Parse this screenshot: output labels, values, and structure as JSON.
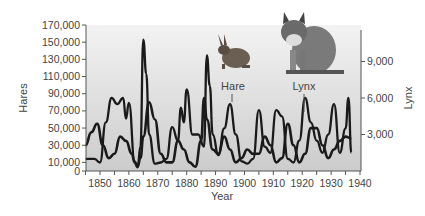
{
  "chart_data": {
    "type": "line",
    "title": "",
    "xlabel": "Year",
    "ylabel": "Hares",
    "y2label": "Lynx",
    "xlim": [
      1845,
      1940
    ],
    "ylim": [
      0,
      170000
    ],
    "y2lim": [
      0,
      12000
    ],
    "x_ticks": [
      "1850",
      "1860",
      "1870",
      "1880",
      "1890",
      "1900",
      "1910",
      "1920",
      "1930",
      "1940"
    ],
    "y_ticks": [
      "0",
      "10,000",
      "30,000",
      "50,000",
      "70,000",
      "90,000",
      "110,000",
      "130,000",
      "150,000",
      "170,000"
    ],
    "y2_ticks": [
      "3,000",
      "6,000",
      "9,000"
    ],
    "annotations": [
      "Hare",
      "Lynx"
    ],
    "series": [
      {
        "name": "Hare",
        "axis": "left",
        "x": [
          1845,
          1847,
          1849,
          1851,
          1853,
          1855,
          1857,
          1859,
          1861,
          1862,
          1863,
          1864,
          1865,
          1867,
          1869,
          1871,
          1873,
          1875,
          1877,
          1879,
          1881,
          1883,
          1885,
          1886,
          1887,
          1889,
          1891,
          1893,
          1895,
          1897,
          1899,
          1901,
          1903,
          1905,
          1907,
          1909,
          1911,
          1913,
          1915,
          1917,
          1919,
          1921,
          1923,
          1925,
          1927,
          1929,
          1931,
          1933,
          1935,
          1937
        ],
        "values": [
          30000,
          45000,
          55000,
          30000,
          15000,
          20000,
          40000,
          35000,
          20000,
          10000,
          5000,
          15000,
          40000,
          80000,
          60000,
          20000,
          10000,
          10000,
          35000,
          25000,
          10000,
          5000,
          35000,
          85000,
          60000,
          25000,
          20000,
          40000,
          25000,
          10000,
          15000,
          25000,
          20000,
          20000,
          40000,
          30000,
          10000,
          15000,
          55000,
          30000,
          10000,
          20000,
          50000,
          50000,
          30000,
          15000,
          25000,
          35000,
          40000,
          38000
        ]
      },
      {
        "name": "Lynx",
        "axis": "right",
        "x": [
          1845,
          1848,
          1850,
          1852,
          1854,
          1856,
          1858,
          1859,
          1860,
          1862,
          1863,
          1864,
          1865,
          1866,
          1867,
          1869,
          1871,
          1873,
          1875,
          1877,
          1878,
          1879,
          1880,
          1882,
          1884,
          1886,
          1887,
          1888,
          1889,
          1891,
          1893,
          1895,
          1897,
          1899,
          1901,
          1903,
          1905,
          1907,
          1909,
          1911,
          1913,
          1915,
          1917,
          1919,
          1921,
          1923,
          1925,
          1927,
          1929,
          1931,
          1933,
          1935,
          1936,
          1937
        ],
        "values": [
          1000,
          1000,
          700,
          4000,
          6000,
          5500,
          6000,
          4300,
          5600,
          800,
          300,
          2000,
          10800,
          8000,
          3000,
          600,
          700,
          1000,
          3600,
          2500,
          5200,
          4000,
          6700,
          3000,
          3000,
          2000,
          9500,
          7000,
          3000,
          1300,
          3500,
          5500,
          3000,
          800,
          600,
          1000,
          5000,
          2000,
          1500,
          5000,
          4500,
          1000,
          700,
          2500,
          6000,
          4000,
          2500,
          1500,
          3000,
          5500,
          1500,
          3500,
          6000,
          1500
        ]
      }
    ]
  },
  "axes": {
    "xlabel": "Year",
    "ylabel_left": "Hares",
    "ylabel_right": "Lynx"
  },
  "labels": {
    "hare": "Hare",
    "lynx": "Lynx"
  },
  "icons": {
    "hare": "hare-illustration",
    "lynx": "lynx-illustration"
  },
  "colors": {
    "plot_bg_top": "#f2f2f2",
    "plot_bg_bottom": "#cfcfcf",
    "line": "#1a1a1a",
    "axis": "#555555"
  }
}
